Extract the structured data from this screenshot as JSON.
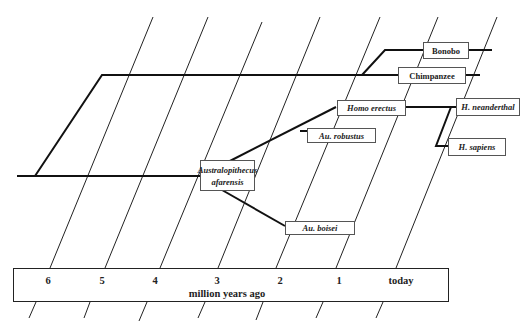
{
  "diagram": {
    "type": "phylogenetic-tree",
    "title": "",
    "taxa": [
      {
        "id": "bonobo",
        "label": "Bonobo",
        "italic": false
      },
      {
        "id": "chimpanzee",
        "label": "Chimpanzee",
        "italic": false
      },
      {
        "id": "homo_erectus",
        "label": "Homo erectus",
        "italic": true
      },
      {
        "id": "au_robustus",
        "label": "Au. robustus",
        "italic": true
      },
      {
        "id": "h_neanderthal",
        "label": "H. neanderthal",
        "italic": true
      },
      {
        "id": "h_sapiens",
        "label": "H. sapiens",
        "italic": true
      },
      {
        "id": "au_afarensis",
        "label": "Australopithecus afarensis",
        "line1": "Australopithecus",
        "line2": "afarensis",
        "italic": true
      },
      {
        "id": "au_boisei",
        "label": "Au. boisei",
        "italic": true
      }
    ],
    "timeline": {
      "ticks": [
        "6",
        "5",
        "4",
        "3",
        "2",
        "1",
        "today"
      ],
      "axis_label": "million years ago"
    },
    "colors": {
      "line": "#111111",
      "box_border": "#555555",
      "background": "#ffffff"
    }
  }
}
